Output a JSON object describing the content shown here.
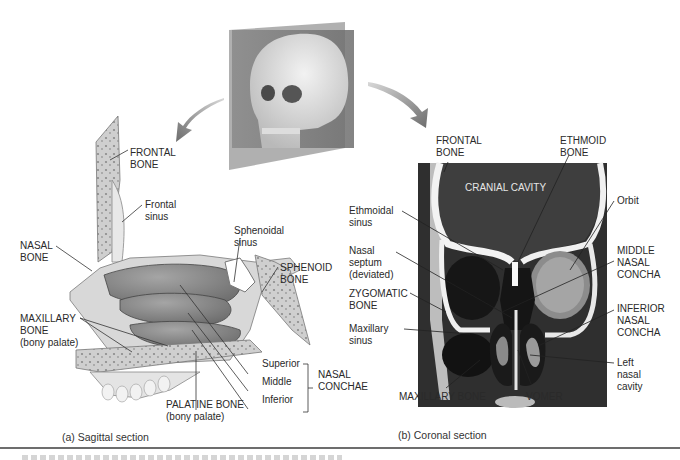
{
  "figure": {
    "panel_a": {
      "caption": "(a)  Sagittal section",
      "labels": {
        "frontal_bone": [
          "FRONTAL",
          "BONE"
        ],
        "frontal_sinus": [
          "Frontal",
          "sinus"
        ],
        "nasal_bone": [
          "NASAL",
          "BONE"
        ],
        "maxillary_bone": [
          "MAXILLARY",
          "BONE",
          "(bony palate)"
        ],
        "sphenoidal_sinus": [
          "Sphenoidal",
          "sinus"
        ],
        "sphenoid_bone": [
          "SPHENOID",
          "BONE"
        ],
        "superior": "Superior",
        "middle": "Middle",
        "inferior": "Inferior",
        "nasal_conchae": [
          "NASAL",
          "CONCHAE"
        ],
        "palatine_bone": [
          "PALATINE BONE",
          "(bony palate)"
        ]
      }
    },
    "panel_b": {
      "caption": "(b)  Coronal section",
      "labels": {
        "frontal_bone": [
          "FRONTAL",
          "BONE"
        ],
        "ethmoid_bone": [
          "ETHMOID",
          "BONE"
        ],
        "cranial_cavity": "CRANIAL CAVITY",
        "ethmoidal_sinus": [
          "Ethmoidal",
          "sinus"
        ],
        "orbit": "Orbit",
        "nasal_septum": [
          "Nasal",
          "septum",
          "(deviated)"
        ],
        "middle_nasal_concha": [
          "MIDDLE",
          "NASAL",
          "CONCHA"
        ],
        "zygomatic_bone": [
          "ZYGOMATIC",
          "BONE"
        ],
        "inferior_nasal_concha": [
          "INFERIOR",
          "NASAL",
          "CONCHA"
        ],
        "maxillary_sinus": [
          "Maxillary",
          "sinus"
        ],
        "left_nasal_cavity": [
          "Left",
          "nasal",
          "cavity"
        ],
        "maxillary_bone": "MAXILLARY BONE",
        "vomer": "VOMER"
      }
    }
  }
}
